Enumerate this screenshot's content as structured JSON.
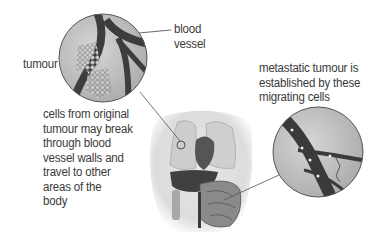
{
  "labels": {
    "blood_vessel": [
      "blood",
      "vessel"
    ],
    "tumour": "tumour",
    "spread_caption": [
      "cells from original",
      "tumour may break",
      "through blood",
      "vessel walls and",
      "travel to other",
      "areas of the",
      "body"
    ],
    "metastatic_caption": [
      "metastatic tumour is",
      "established by these",
      "migrating cells"
    ]
  },
  "colors": {
    "vessel": "#3d3d3d",
    "tissue": "#c8c8c8",
    "organ_dark": "#4a4a4a",
    "body": "#e4e4e4"
  }
}
